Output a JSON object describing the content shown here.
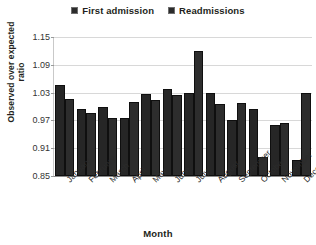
{
  "chart_data": {
    "type": "bar",
    "title": "",
    "xlabel": "Month",
    "ylabel": "Observed over expected ratio",
    "ylim": [
      0.85,
      1.15
    ],
    "yticks": [
      "0.85",
      "0.91",
      "0.97",
      "1.03",
      "1.09",
      "1.15"
    ],
    "ytick_values": [
      0.85,
      0.91,
      0.97,
      1.03,
      1.09,
      1.15
    ],
    "grid": true,
    "legend_position": "top-center",
    "categories": [
      "January",
      "February",
      "March",
      "April",
      "May",
      "June",
      "July",
      "August",
      "September",
      "October",
      "November",
      "December"
    ],
    "series": [
      {
        "name": "First admission",
        "color": "#262626",
        "values": [
          1.046,
          0.995,
          1.0,
          0.975,
          1.028,
          1.038,
          1.03,
          1.03,
          0.97,
          0.995,
          0.96,
          0.885
        ]
      },
      {
        "name": "Readmissions",
        "color": "#2d2d2d",
        "values": [
          1.016,
          0.985,
          0.975,
          1.01,
          1.015,
          1.025,
          1.12,
          1.005,
          1.008,
          0.89,
          0.965,
          1.03
        ]
      }
    ]
  },
  "legend": {
    "entries": [
      {
        "label": "First admission"
      },
      {
        "label": "Readmissions"
      }
    ]
  },
  "axis": {
    "x_title": "Month",
    "y_title": "Observed over expected ratio"
  },
  "colors": {
    "bar": "#262626",
    "grid": "#d8d8d8",
    "axis": "#8a8a8a",
    "text": "#231f20",
    "background": "#ffffff"
  }
}
